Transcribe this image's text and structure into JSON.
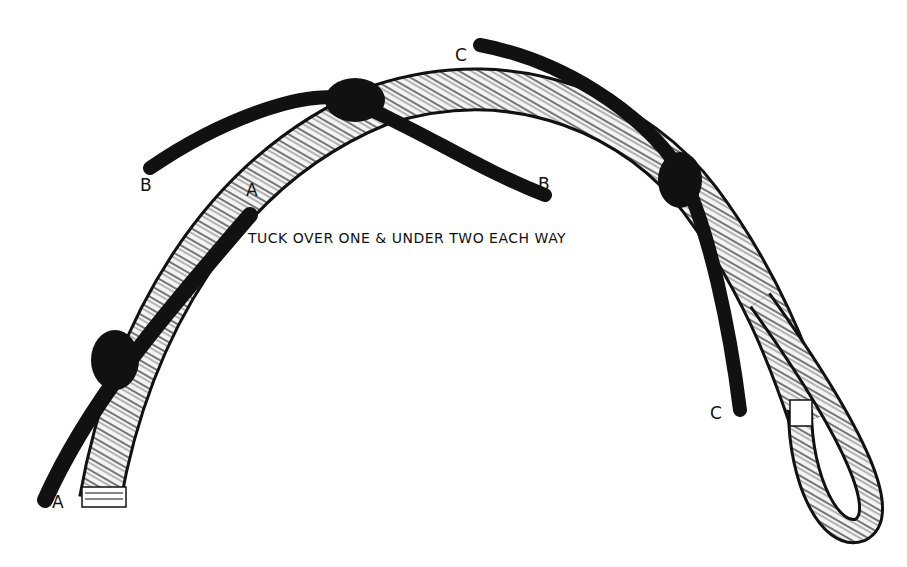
{
  "figure": {
    "caption": "TUCK OVER ONE & UNDER TWO EACH WAY",
    "labels": [
      {
        "id": "B-left",
        "text": "B",
        "x": 140,
        "y": 175
      },
      {
        "id": "A-upper",
        "text": "A",
        "x": 246,
        "y": 180
      },
      {
        "id": "C-top",
        "text": "C",
        "x": 455,
        "y": 45
      },
      {
        "id": "B-right",
        "text": "B",
        "x": 538,
        "y": 174
      },
      {
        "id": "C-right",
        "text": "C",
        "x": 710,
        "y": 403
      },
      {
        "id": "A-lower",
        "text": "A",
        "x": 52,
        "y": 492
      }
    ],
    "colors": {
      "ink": "#111111",
      "paper": "#ffffff",
      "rope_fill": "#f4f4f4"
    }
  }
}
